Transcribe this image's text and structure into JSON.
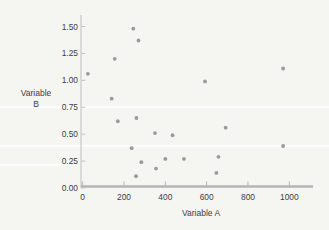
{
  "figure": {
    "background_color": "#f5f5f2"
  },
  "chart_data": {
    "type": "scatter",
    "title": "",
    "xlabel": "Variable A",
    "ylabel": "Variable B",
    "xlim": [
      0,
      1115
    ],
    "ylim": [
      0,
      1.58
    ],
    "grid": false,
    "legend": null,
    "x_ticks": {
      "values": [
        0,
        200,
        400,
        600,
        800,
        1000
      ],
      "labels": [
        "0",
        "200",
        "400",
        "600",
        "800",
        "1000"
      ]
    },
    "y_ticks": {
      "values": [
        0,
        0.25,
        0.5,
        0.75,
        1,
        1.25,
        1.5
      ],
      "labels": [
        "0.00",
        "0.25",
        "0.50",
        "0.75",
        "1.00",
        "1.25",
        "1.50"
      ]
    },
    "points": [
      [
        25,
        1.06
      ],
      [
        155,
        1.2
      ],
      [
        245,
        1.48
      ],
      [
        270,
        1.37
      ],
      [
        140,
        0.83
      ],
      [
        170,
        0.62
      ],
      [
        260,
        0.65
      ],
      [
        237,
        0.37
      ],
      [
        258,
        0.11
      ],
      [
        284,
        0.24
      ],
      [
        350,
        0.51
      ],
      [
        355,
        0.18
      ],
      [
        400,
        0.27
      ],
      [
        435,
        0.49
      ],
      [
        490,
        0.27
      ],
      [
        592,
        0.99
      ],
      [
        647,
        0.14
      ],
      [
        657,
        0.29
      ],
      [
        692,
        0.56
      ],
      [
        970,
        1.11
      ],
      [
        970,
        0.39
      ]
    ],
    "colors": {
      "point": "#8d8d8d",
      "x_axis": "#b4b4b4",
      "y_axis": "#c2c2c2",
      "text": "#3d3d3d"
    }
  }
}
